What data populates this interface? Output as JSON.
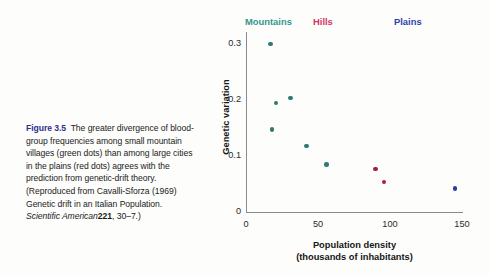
{
  "caption": {
    "figure_label": "Figure 3.5",
    "body_part_1": "The greater divergence of blood-group frequencies among small mountain villages (green dots) than among large cities in the plains (red dots) agrees with the prediction from genetic-drift theory. (Reproduced from Cavalli-Sforza (1969) Genetic drift in an Italian Population.",
    "journal": "Scientific American",
    "volume": "221",
    "pages": ", 30–7.)",
    "label_color": "#2e3192"
  },
  "chart_data": {
    "type": "scatter",
    "title": "",
    "xlabel": "Population density\n(thousands of inhabitants)",
    "xlabel_line1": "Population density",
    "xlabel_line2": "(thousands of inhabitants)",
    "ylabel": "Genetic variation",
    "xlim": [
      0,
      155
    ],
    "ylim": [
      0,
      0.335
    ],
    "xticks": [
      0,
      50,
      100,
      150
    ],
    "xtick_labels": [
      "0",
      "50",
      "100",
      "150"
    ],
    "yticks": [
      0,
      0.1,
      0.2,
      0.3
    ],
    "ytick_labels": [
      "0",
      "0.1",
      "0.2",
      "0.3"
    ],
    "grid": false,
    "legend_position": "top",
    "series": [
      {
        "name": "Mountains",
        "color": "#2d7b72",
        "label_color": "#36978b",
        "points": [
          {
            "x": 17,
            "y": 0.3
          },
          {
            "x": 21,
            "y": 0.195
          },
          {
            "x": 31,
            "y": 0.204
          },
          {
            "x": 18,
            "y": 0.147
          },
          {
            "x": 42,
            "y": 0.118
          },
          {
            "x": 56,
            "y": 0.085
          }
        ]
      },
      {
        "name": "Hills",
        "color": "#a51c45",
        "label_color": "#d1355f",
        "points": [
          {
            "x": 90,
            "y": 0.077
          },
          {
            "x": 96,
            "y": 0.054
          }
        ]
      },
      {
        "name": "Plains",
        "color": "#2d3c9e",
        "label_color": "#2f3fa8",
        "points": [
          {
            "x": 145,
            "y": 0.042
          }
        ]
      }
    ],
    "series_label_x": [
      45,
      113,
      194
    ]
  }
}
